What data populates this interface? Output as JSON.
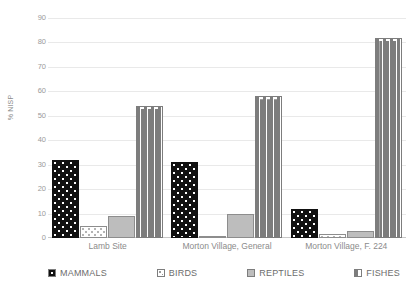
{
  "chart_data": {
    "type": "bar",
    "title": "",
    "xlabel": "",
    "ylabel": "% NISP",
    "ylim": [
      0,
      90
    ],
    "yticks": [
      90,
      80,
      70,
      60,
      50,
      40,
      30,
      20,
      10,
      0
    ],
    "grid": true,
    "legend_position": "bottom",
    "categories": [
      "Lamb Site",
      "Morton Village, General",
      "Morton Village, F. 224"
    ],
    "series": [
      {
        "name": "MAMMALS",
        "values": [
          32,
          31,
          12
        ],
        "color": "#111111",
        "pattern": "dots-on-black"
      },
      {
        "name": "BIRDS",
        "values": [
          5,
          1,
          1.5
        ],
        "color": "#ffffff",
        "pattern": "dotted"
      },
      {
        "name": "REPTILES",
        "values": [
          9,
          10,
          3
        ],
        "color": "#bdbdbd",
        "pattern": "solid-gray"
      },
      {
        "name": "FISHES",
        "values": [
          54,
          58,
          82
        ],
        "color": "#ffffff",
        "pattern": "dashes"
      }
    ]
  },
  "axis": {
    "y_title": "% NISP",
    "y_tick_labels": [
      "90",
      "80",
      "70",
      "60",
      "50",
      "40",
      "30",
      "20",
      "10",
      "0"
    ]
  },
  "legend": {
    "items": [
      {
        "label": "MAMMALS"
      },
      {
        "label": "BIRDS"
      },
      {
        "label": "REPTILES"
      },
      {
        "label": "FISHES"
      }
    ]
  }
}
